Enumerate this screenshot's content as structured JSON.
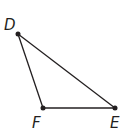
{
  "figure": {
    "type": "triangle",
    "stroke_color": "#231f20",
    "vertices": [
      {
        "label": "D",
        "x": 18,
        "y": 34,
        "label_x": 4,
        "label_y": 30
      },
      {
        "label": "F",
        "x": 43,
        "y": 108,
        "label_x": 32,
        "label_y": 128
      },
      {
        "label": "E",
        "x": 115,
        "y": 108,
        "label_x": 110,
        "label_y": 128
      }
    ],
    "sides": [
      {
        "name": "DF",
        "from": "D",
        "to": "F"
      },
      {
        "name": "FE",
        "from": "F",
        "to": "E"
      },
      {
        "name": "DE",
        "from": "D",
        "to": "E"
      }
    ]
  }
}
